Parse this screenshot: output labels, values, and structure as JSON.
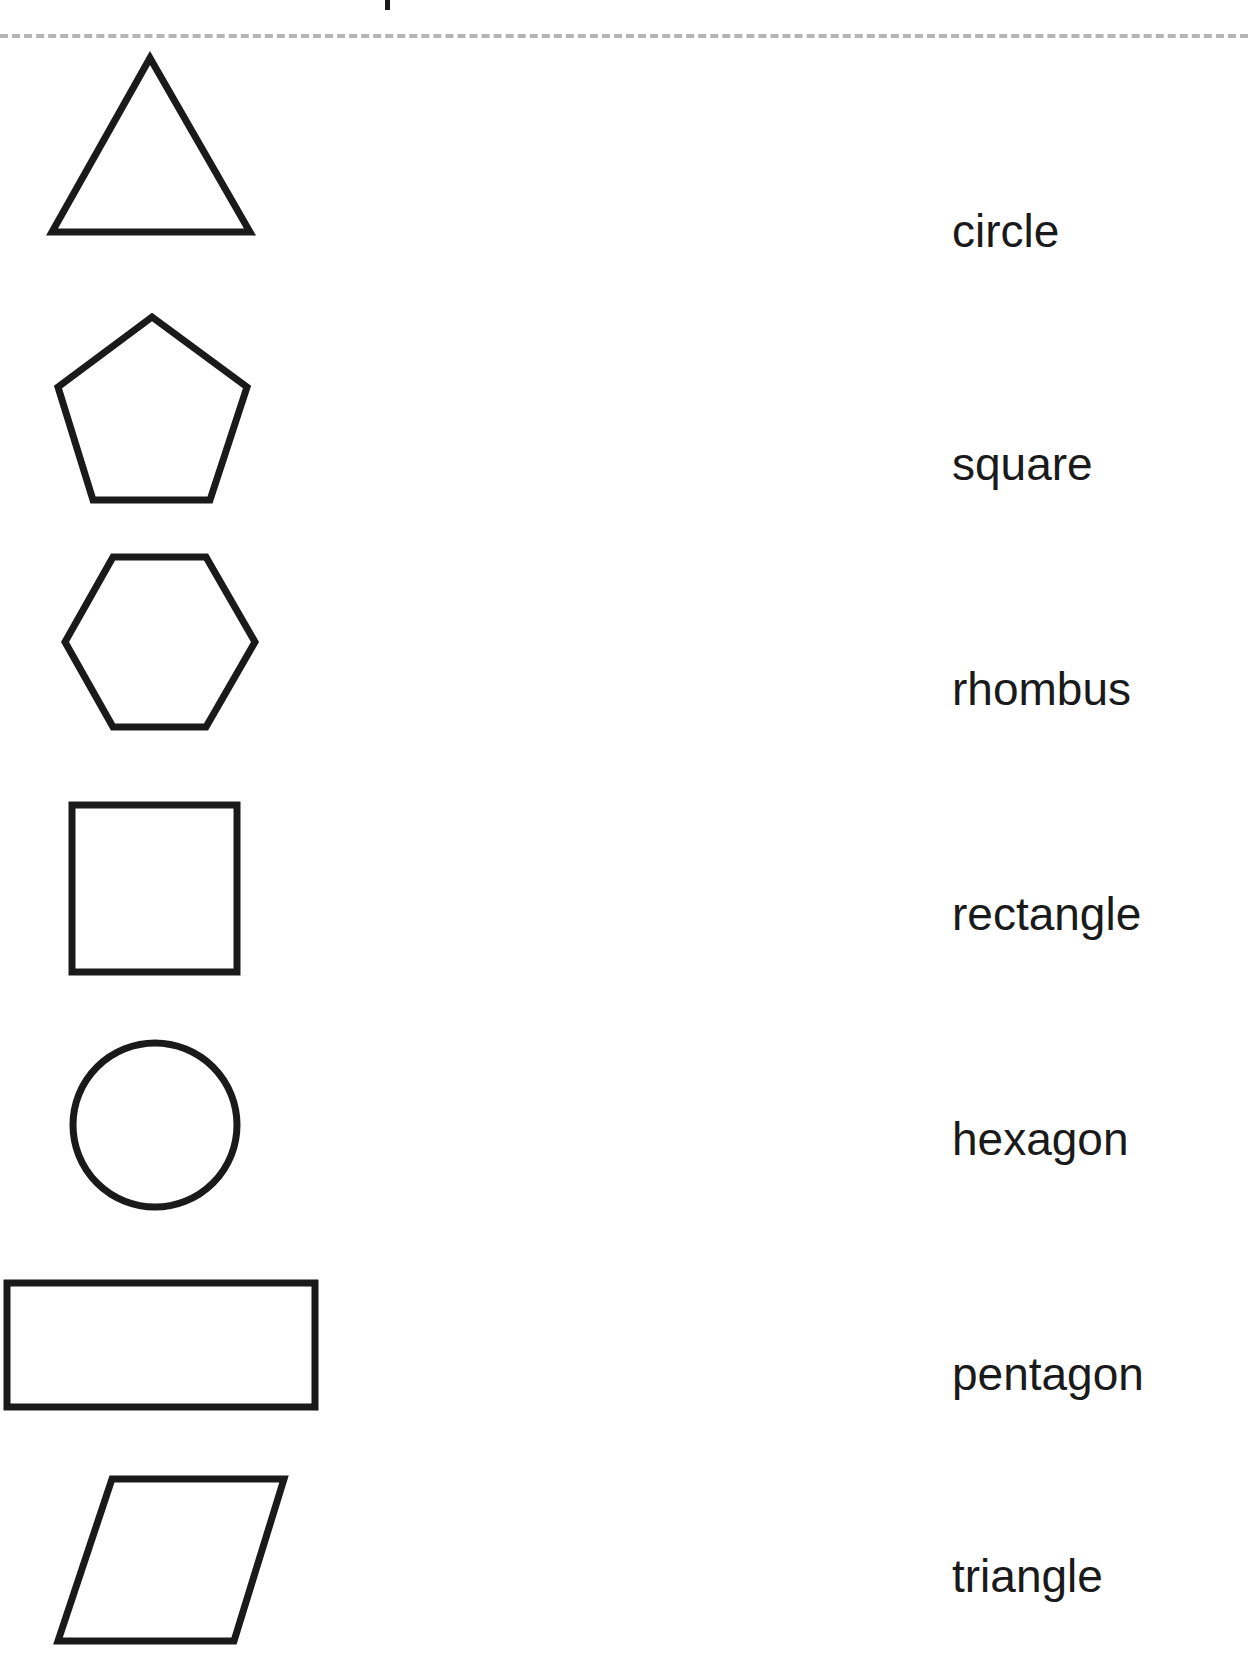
{
  "worksheet": {
    "title_partial": "p",
    "divider": "dotted-line",
    "shapes": [
      {
        "name": "triangle-shape",
        "kind": "triangle"
      },
      {
        "name": "pentagon-shape",
        "kind": "pentagon"
      },
      {
        "name": "hexagon-shape",
        "kind": "hexagon"
      },
      {
        "name": "square-shape",
        "kind": "square"
      },
      {
        "name": "circle-shape",
        "kind": "circle"
      },
      {
        "name": "rectangle-shape",
        "kind": "rectangle"
      },
      {
        "name": "rhombus-shape",
        "kind": "parallelogram/rhombus"
      }
    ],
    "words": [
      "circle",
      "square",
      "rhombus",
      "rectangle",
      "hexagon",
      "pentagon",
      "triangle"
    ]
  },
  "colors": {
    "ink": "#1a1a1a",
    "divider": "#b5b5b5",
    "background": "#ffffff"
  }
}
